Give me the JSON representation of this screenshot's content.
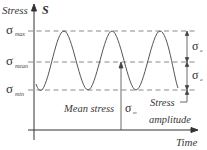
{
  "diagram": {
    "y_axis": {
      "label": "Stress",
      "symbol": "S"
    },
    "x_axis": {
      "label": "Time"
    },
    "levels": [
      {
        "name": "max",
        "symbol": "σ",
        "subscript": "max"
      },
      {
        "name": "mean",
        "symbol": "σ",
        "subscript": "mean"
      },
      {
        "name": "min",
        "symbol": "σ",
        "subscript": "min"
      }
    ],
    "annotations": {
      "mean_stress_label": "Mean stress",
      "mean_stress_symbol": "σ",
      "mean_stress_subscript": "m",
      "amplitude_symbol": "σ",
      "amplitude_subscript": "a",
      "amplitude_label_line1": "Stress",
      "amplitude_label_line2": "amplitude"
    },
    "colors": {
      "axis": "#333333",
      "curve": "#555555",
      "dashed": "#666666",
      "text": "#3a3a3a"
    }
  }
}
